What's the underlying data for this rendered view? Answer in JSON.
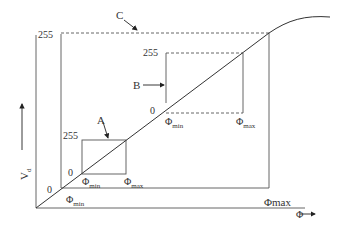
{
  "diagram": {
    "axes": {
      "y_label": "V",
      "y_label_sub": "d",
      "x_label": "Φ"
    },
    "outer": {
      "top_value": "255",
      "zero_value": "0",
      "phi_min": "Φ",
      "phi_min_sub": "min",
      "phi_max": "Φmax"
    },
    "box_a": {
      "name": "A",
      "top_value": "255",
      "zero_value": "0",
      "phi_min": "Φ",
      "phi_min_sub": "min",
      "phi_max": "Φ",
      "phi_max_sub": "max"
    },
    "box_b": {
      "name": "B",
      "top_value": "255",
      "zero_value": "0",
      "phi_min": "Φ",
      "phi_min_sub": "min",
      "phi_max": "Φ",
      "phi_max_sub": "max"
    },
    "box_c": {
      "name": "C"
    },
    "colors": {
      "line": "#444444",
      "background": "#ffffff"
    }
  }
}
